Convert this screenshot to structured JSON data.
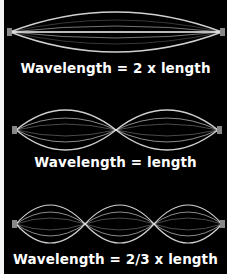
{
  "colors": {
    "background": "#000000",
    "string": "#e8e8e8",
    "text": "#ffffff",
    "margin": "#ffffff"
  },
  "diagram": {
    "modes": [
      {
        "caption": "Wavelength = 2 x length",
        "loops": 1
      },
      {
        "caption": "Wavelength = length",
        "loops": 2
      },
      {
        "caption": "Wavelength = 2/3 x length",
        "loops": 3
      }
    ]
  }
}
